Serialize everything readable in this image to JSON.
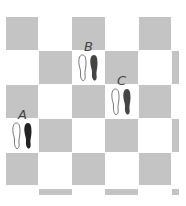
{
  "diagram": {
    "type": "checkerboard-floor-with-footprints",
    "colors": {
      "gray_square": "#c4c4c4",
      "white_square": "#ffffff",
      "left_foot": "#ffffff",
      "right_foot": "#333333"
    },
    "positions": [
      {
        "label": "A",
        "row": 4,
        "col": 1
      },
      {
        "label": "B",
        "row": 2,
        "col": 3
      },
      {
        "label": "C",
        "row": 3,
        "col": 4
      }
    ]
  }
}
